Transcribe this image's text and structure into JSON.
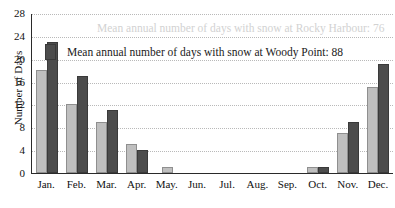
{
  "chart_data": {
    "type": "bar",
    "title": "",
    "xlabel": "",
    "ylabel": "Number of Days",
    "ylim": [
      0,
      28
    ],
    "yticks": [
      0,
      4,
      8,
      12,
      16,
      20,
      24,
      28
    ],
    "grid": true,
    "legend_position": "inside-top",
    "categories": [
      "Jan.",
      "Feb.",
      "Mar.",
      "Apr.",
      "May.",
      "Jun.",
      "Jul.",
      "Aug.",
      "Sep.",
      "Oct.",
      "Nov.",
      "Dec."
    ],
    "series": [
      {
        "name": "Rocky Harbour",
        "color": "#bfbfbf",
        "total": 76,
        "values": [
          18,
          12,
          9,
          5,
          1,
          0,
          0,
          0,
          0,
          1,
          7,
          15
        ]
      },
      {
        "name": "Woody Point",
        "color": "#4d4d4d",
        "total": 88,
        "values": [
          23,
          17,
          11,
          4,
          0,
          0,
          0,
          0,
          0,
          1,
          9,
          19
        ]
      }
    ],
    "annotations": [
      "Mean annual number of days with snow at Rocky Harbour: 76",
      "Mean annual number of days with snow at Woody Point: 88"
    ]
  },
  "axis": {
    "y_title": "Number of Days",
    "y_ticks": [
      "28",
      "24",
      "20",
      "16",
      "12",
      "8",
      "4",
      "0"
    ],
    "x_ticks": [
      "Jan.",
      "Feb.",
      "Mar.",
      "Apr.",
      "May.",
      "Jun.",
      "Jul.",
      "Aug.",
      "Sep.",
      "Oct.",
      "Nov.",
      "Dec."
    ]
  },
  "legend": {
    "rocky": {
      "label": "Mean annual number of days with snow at Rocky Harbour: 76",
      "color": "#bfbfbf"
    },
    "woody": {
      "label": "Mean annual number of days with snow at Woody Point: 88",
      "color": "#4d4d4d"
    }
  }
}
